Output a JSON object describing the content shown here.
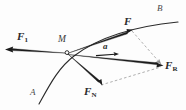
{
  "figure": {
    "background_color": "#fdfdfd",
    "stroke_color": "#1c1c1c",
    "dashed_color": "#9a9a9a",
    "curve_color": "#2b2b2b",
    "width": 186,
    "height": 110
  },
  "point": {
    "vertex_label": "M",
    "vertex_x": 67,
    "vertex_y": 52
  },
  "curve": {
    "name": "trajectory-curve",
    "start_label": "A",
    "end_label": "B",
    "path": "M 39,104 C 49,86 58,68 74,56 C 95,40 127,27 178,22"
  },
  "vectors": [
    {
      "id": "F1",
      "name": "force-vector-f1",
      "label": "F",
      "subscript": "1",
      "bold": true,
      "x1": 67,
      "y1": 52,
      "x2": 6,
      "y2": 50,
      "label_x": 17,
      "label_y": 33
    },
    {
      "id": "F",
      "name": "force-vector-f",
      "label": "F",
      "subscript": "",
      "bold": true,
      "x1": 67,
      "y1": 52,
      "x2": 132,
      "y2": 31,
      "label_x": 125,
      "label_y": 18
    },
    {
      "id": "FR",
      "name": "resultant-force-vector-fr",
      "label": "F",
      "subscript": "R",
      "bold": true,
      "x1": 67,
      "y1": 52,
      "x2": 163,
      "y2": 66,
      "label_x": 165,
      "label_y": 61
    },
    {
      "id": "FN",
      "name": "normal-force-vector-fn",
      "label": "F",
      "subscript": "N",
      "bold": true,
      "x1": 67,
      "y1": 52,
      "x2": 101,
      "y2": 85,
      "label_x": 87,
      "label_y": 88
    },
    {
      "id": "a",
      "name": "acceleration-vector-a",
      "label": "a",
      "subscript": "",
      "bold": true,
      "x1": 95,
      "y1": 56,
      "x2": 118,
      "y2": 54,
      "label_x": 104,
      "label_y": 44
    }
  ],
  "construction_lines": [
    {
      "name": "dashed-line-f-to-fr",
      "x1": 132,
      "y1": 31,
      "x2": 163,
      "y2": 66
    },
    {
      "name": "dashed-line-fn-to-fr",
      "x1": 101,
      "y1": 85,
      "x2": 163,
      "y2": 66
    }
  ],
  "labels": {
    "curve_start": "A",
    "curve_end": "B",
    "vertex": "M"
  },
  "label_positions": {
    "curve_start_x": 33,
    "curve_start_y": 90,
    "curve_end_x": 160,
    "curve_end_y": 5,
    "vertex_x": 58,
    "vertex_y": 36
  }
}
